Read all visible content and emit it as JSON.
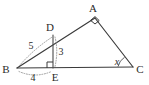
{
  "figure": {
    "kind": "euclidean-geometry-diagram",
    "background_color": "#ffffff",
    "stroke_color": "#3a3a3a",
    "dotted_color": "#8d8d8d",
    "label_color": "#2b2b2b",
    "vertices": {
      "a": {
        "label": "A",
        "x": 95,
        "y": 18,
        "label_x": 93,
        "label_y": 12
      },
      "b": {
        "label": "B",
        "x": 17,
        "y": 68,
        "label_x": 3,
        "label_y": 72
      },
      "c": {
        "label": "C",
        "x": 133,
        "y": 67,
        "label_x": 137,
        "label_y": 72
      },
      "d": {
        "label": "D",
        "x": 53,
        "y": 35,
        "label_x": 48,
        "label_y": 30
      },
      "e": {
        "label": "E",
        "x": 53,
        "y": 68,
        "label_x": 51,
        "label_y": 80
      }
    },
    "measures": {
      "bd": {
        "label": "5",
        "x": 31,
        "y": 46
      },
      "de": {
        "label": "3",
        "x": 59,
        "y": 52
      },
      "be": {
        "label": "4",
        "x": 33,
        "y": 80
      }
    },
    "angles": {
      "at_c": {
        "label": "x",
        "x": 116,
        "y": 64,
        "marker": "arc"
      },
      "at_a": {
        "label": "",
        "marker": "right-angle-square"
      },
      "at_e": {
        "label": "",
        "marker": "right-angle-square"
      }
    }
  }
}
